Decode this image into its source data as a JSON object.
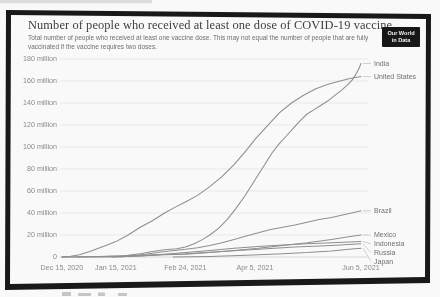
{
  "header": {
    "title": "Number of people who received at least one dose of COVID-19 vaccine",
    "subtitle": "Total number of people who received at least one vaccine dose. This may not equal the number of people that are fully vaccinated if the vaccine requires two doses.",
    "logo": {
      "line1": "Our World",
      "line2": "in Data"
    }
  },
  "colors": {
    "frame": "#161616",
    "line": "#8f8f8f",
    "grid": "#eaeaea",
    "grid_zero": "#d7d7d7",
    "axis_text": "#8a8a8a",
    "entity_text": "#6f6f6f",
    "leader": "#c4c4c4",
    "title_text": "#3c3c3c",
    "subtitle_text": "#6e6e6e",
    "logo_bg": "#141414",
    "logo_text": "#f2f2f2",
    "artifact": "#9a9a9a"
  },
  "chart_data": {
    "type": "line",
    "title": "Number of people who received at least one dose of COVID-19 vaccine",
    "subtitle": "Total number of people who received at least one vaccine dose. This may not equal the number of people that are fully vaccinated if the vaccine requires two doses.",
    "values_unit": "people (millions)",
    "x_axis": {
      "kind": "date",
      "start": "Dec 15, 2020",
      "end": "Jun 5, 2021",
      "ticks": [
        {
          "label": "Dec 15, 2020",
          "day": 0
        },
        {
          "label": "Jan 15, 2021",
          "day": 31
        },
        {
          "label": "Feb 24, 2021",
          "day": 71
        },
        {
          "label": "Apr 5, 2021",
          "day": 111
        },
        {
          "label": "Jun 5, 2021",
          "day": 172
        }
      ]
    },
    "y_axis": {
      "range": [
        0,
        180
      ],
      "grid": true,
      "ticks": [
        {
          "label": "180 million",
          "value": 180
        },
        {
          "label": "160 million",
          "value": 160
        },
        {
          "label": "140 million",
          "value": 140
        },
        {
          "label": "120 million",
          "value": 120
        },
        {
          "label": "100 million",
          "value": 100
        },
        {
          "label": "80 million",
          "value": 80
        },
        {
          "label": "60 million",
          "value": 60
        },
        {
          "label": "40 million",
          "value": 40
        },
        {
          "label": "20 million",
          "value": 20
        },
        {
          "label": "0",
          "value": 0
        }
      ]
    },
    "legend_position": "right-of-line-ends",
    "series": [
      {
        "name": "India",
        "points": [
          [
            0,
            0
          ],
          [
            31,
            0
          ],
          [
            33,
            0.5
          ],
          [
            38,
            1.5
          ],
          [
            45,
            3
          ],
          [
            52,
            5
          ],
          [
            59,
            6.5
          ],
          [
            66,
            7.5
          ],
          [
            71,
            9
          ],
          [
            76,
            12
          ],
          [
            81,
            16
          ],
          [
            85,
            20
          ],
          [
            90,
            26
          ],
          [
            95,
            34
          ],
          [
            100,
            44
          ],
          [
            105,
            55
          ],
          [
            109,
            65
          ],
          [
            113,
            75
          ],
          [
            117,
            85
          ],
          [
            121,
            95
          ],
          [
            125,
            103
          ],
          [
            129,
            110
          ],
          [
            133,
            117
          ],
          [
            137,
            124
          ],
          [
            141,
            130
          ],
          [
            145,
            134
          ],
          [
            149,
            138
          ],
          [
            153,
            142
          ],
          [
            157,
            147
          ],
          [
            161,
            152
          ],
          [
            164,
            156
          ],
          [
            167,
            161
          ],
          [
            169,
            166
          ],
          [
            171,
            172
          ],
          [
            172,
            176
          ]
        ]
      },
      {
        "name": "United States",
        "points": [
          [
            0,
            0
          ],
          [
            5,
            0.6
          ],
          [
            10,
            2
          ],
          [
            16,
            5
          ],
          [
            21,
            8
          ],
          [
            26,
            11
          ],
          [
            31,
            14
          ],
          [
            38,
            20
          ],
          [
            45,
            27
          ],
          [
            52,
            33
          ],
          [
            59,
            40
          ],
          [
            66,
            46
          ],
          [
            71,
            50
          ],
          [
            78,
            56
          ],
          [
            85,
            64
          ],
          [
            92,
            73
          ],
          [
            99,
            84
          ],
          [
            106,
            97
          ],
          [
            111,
            107
          ],
          [
            118,
            119
          ],
          [
            125,
            131
          ],
          [
            132,
            140
          ],
          [
            139,
            147
          ],
          [
            146,
            153
          ],
          [
            153,
            157
          ],
          [
            160,
            160
          ],
          [
            165,
            162
          ],
          [
            172,
            164
          ]
        ]
      },
      {
        "name": "Brazil",
        "points": [
          [
            33,
            0
          ],
          [
            40,
            1
          ],
          [
            48,
            2.5
          ],
          [
            55,
            4
          ],
          [
            62,
            5.5
          ],
          [
            71,
            7
          ],
          [
            78,
            8.5
          ],
          [
            85,
            10.5
          ],
          [
            92,
            13
          ],
          [
            99,
            16
          ],
          [
            106,
            19
          ],
          [
            113,
            22
          ],
          [
            120,
            25
          ],
          [
            127,
            27
          ],
          [
            134,
            29
          ],
          [
            141,
            31.5
          ],
          [
            148,
            34
          ],
          [
            155,
            36
          ],
          [
            162,
            38.5
          ],
          [
            169,
            41
          ],
          [
            172,
            42
          ]
        ]
      },
      {
        "name": "Mexico",
        "points": [
          [
            9,
            0
          ],
          [
            31,
            0.7
          ],
          [
            45,
            1
          ],
          [
            59,
            2
          ],
          [
            71,
            2.5
          ],
          [
            85,
            4
          ],
          [
            99,
            6
          ],
          [
            113,
            8
          ],
          [
            127,
            10.5
          ],
          [
            141,
            13
          ],
          [
            155,
            16
          ],
          [
            165,
            18.5
          ],
          [
            172,
            20
          ]
        ]
      },
      {
        "name": "Indonesia",
        "points": [
          [
            29,
            0
          ],
          [
            45,
            1
          ],
          [
            59,
            2.5
          ],
          [
            71,
            4
          ],
          [
            85,
            6
          ],
          [
            99,
            8
          ],
          [
            113,
            9.5
          ],
          [
            127,
            11
          ],
          [
            141,
            12
          ],
          [
            155,
            13
          ],
          [
            172,
            14
          ]
        ]
      },
      {
        "name": "Russia",
        "points": [
          [
            0,
            0
          ],
          [
            21,
            0.5
          ],
          [
            45,
            1.5
          ],
          [
            71,
            3
          ],
          [
            92,
            5
          ],
          [
            113,
            7
          ],
          [
            134,
            9
          ],
          [
            155,
            10.5
          ],
          [
            172,
            12
          ]
        ]
      },
      {
        "name": "Japan",
        "points": [
          [
            64,
            0
          ],
          [
            85,
            0.5
          ],
          [
            106,
            1.5
          ],
          [
            127,
            3
          ],
          [
            141,
            4
          ],
          [
            155,
            5.5
          ],
          [
            165,
            7
          ],
          [
            172,
            8
          ]
        ]
      }
    ]
  }
}
